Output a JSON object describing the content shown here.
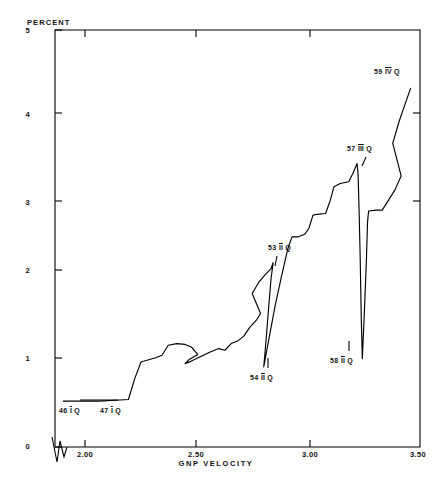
{
  "header": {
    "clipped_top_text": "FIGURE 5.  GNP VELOCITY"
  },
  "chart_data": {
    "type": "line",
    "title": "",
    "xlabel": "GNP VELOCITY",
    "ylabel": "PERCENT",
    "xlim": [
      1.76,
      3.5
    ],
    "ylim": [
      0,
      5
    ],
    "xticks": [
      2.0,
      2.5,
      3.0,
      3.5
    ],
    "xtick_labels": [
      "2.00",
      "2.50",
      "3.00",
      "3.50"
    ],
    "yticks": [
      0,
      1,
      2,
      3,
      4,
      5
    ],
    "ytick_labels": [
      "0",
      "1",
      "2",
      "3",
      "4",
      "5"
    ],
    "grid": false,
    "legend": "none",
    "axis_break_on_x": true,
    "series": [
      {
        "name": "interest rate vs GNP velocity path",
        "points": [
          [
            1.8,
            0.55
          ],
          [
            1.88,
            0.55
          ],
          [
            1.97,
            0.55
          ],
          [
            2.05,
            0.56
          ],
          [
            2.11,
            0.57
          ],
          [
            2.14,
            0.82
          ],
          [
            2.17,
            1.02
          ],
          [
            2.24,
            1.07
          ],
          [
            2.27,
            1.1
          ],
          [
            2.3,
            1.22
          ],
          [
            2.34,
            1.24
          ],
          [
            2.38,
            1.23
          ],
          [
            2.41,
            1.2
          ],
          [
            2.44,
            1.11
          ],
          [
            2.4,
            1.05
          ],
          [
            2.38,
            1.0
          ],
          [
            2.41,
            1.03
          ],
          [
            2.45,
            1.08
          ],
          [
            2.5,
            1.14
          ],
          [
            2.54,
            1.18
          ],
          [
            2.57,
            1.16
          ],
          [
            2.6,
            1.24
          ],
          [
            2.63,
            1.27
          ],
          [
            2.66,
            1.33
          ],
          [
            2.69,
            1.44
          ],
          [
            2.72,
            1.52
          ],
          [
            2.74,
            1.6
          ],
          [
            2.72,
            1.72
          ],
          [
            2.7,
            1.84
          ],
          [
            2.73,
            1.97
          ],
          [
            2.76,
            2.06
          ],
          [
            2.79,
            2.14
          ],
          [
            2.8,
            2.21
          ],
          [
            2.79,
            2.02
          ],
          [
            2.78,
            1.72
          ],
          [
            2.77,
            1.4
          ],
          [
            2.76,
            1.1
          ],
          [
            2.755,
            0.96
          ],
          [
            2.78,
            1.3
          ],
          [
            2.81,
            1.7
          ],
          [
            2.84,
            2.05
          ],
          [
            2.87,
            2.38
          ],
          [
            2.89,
            2.52
          ],
          [
            2.92,
            2.52
          ],
          [
            2.95,
            2.55
          ],
          [
            2.97,
            2.62
          ],
          [
            2.99,
            2.78
          ],
          [
            3.01,
            2.79
          ],
          [
            3.05,
            2.8
          ],
          [
            3.07,
            2.94
          ],
          [
            3.09,
            3.12
          ],
          [
            3.12,
            3.16
          ],
          [
            3.16,
            3.18
          ],
          [
            3.18,
            3.28
          ],
          [
            3.2,
            3.4
          ],
          [
            3.205,
            3.26
          ],
          [
            3.21,
            2.8
          ],
          [
            3.215,
            2.25
          ],
          [
            3.22,
            1.55
          ],
          [
            3.225,
            1.06
          ],
          [
            3.235,
            1.62
          ],
          [
            3.245,
            2.28
          ],
          [
            3.25,
            2.7
          ],
          [
            3.255,
            2.83
          ],
          [
            3.29,
            2.84
          ],
          [
            3.32,
            2.84
          ],
          [
            3.35,
            2.96
          ],
          [
            3.38,
            3.08
          ],
          [
            3.41,
            3.25
          ],
          [
            3.39,
            3.45
          ],
          [
            3.37,
            3.64
          ],
          [
            3.4,
            3.9
          ],
          [
            3.43,
            4.12
          ],
          [
            3.455,
            4.3
          ]
        ]
      }
    ],
    "annotations": [
      {
        "id": "a46",
        "text": "46 I Q",
        "roman": "I",
        "year": "46",
        "suffix": "Q",
        "x_px": 59,
        "y_px": 407
      },
      {
        "id": "a47",
        "text": "47 I Q",
        "roman": "I",
        "year": "47",
        "suffix": "Q",
        "x_px": 100,
        "y_px": 407
      },
      {
        "id": "a53",
        "text": "53 II Q",
        "roman": "II",
        "year": "53",
        "suffix": "Q",
        "x_px": 268,
        "y_px": 244
      },
      {
        "id": "a54",
        "text": "54 II Q",
        "roman": "II",
        "year": "54",
        "suffix": "Q",
        "x_px": 250,
        "y_px": 374
      },
      {
        "id": "a57",
        "text": "57 III Q",
        "roman": "III",
        "year": "57",
        "suffix": "Q",
        "x_px": 347,
        "y_px": 145
      },
      {
        "id": "a58",
        "text": "58 II Q",
        "roman": "II",
        "year": "58",
        "suffix": "Q",
        "x_px": 330,
        "y_px": 357
      },
      {
        "id": "a59",
        "text": "59 IV Q",
        "roman": "IV",
        "year": "59",
        "suffix": "Q",
        "x_px": 374,
        "y_px": 68
      }
    ],
    "colors": {
      "line": "#000000",
      "axis": "#000000",
      "background": "#ffffff"
    }
  }
}
